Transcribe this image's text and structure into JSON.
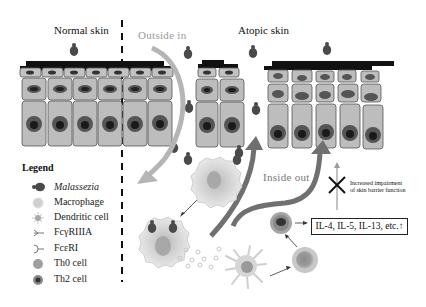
{
  "diagram": {
    "panels": {
      "normal_skin": "Normal skin",
      "atopic_skin": "Atopic skin"
    },
    "pathways": {
      "outside_in": "Outside in",
      "inside_out": "Inside out"
    },
    "annotations": {
      "barrier_line1": "Increased impairment",
      "barrier_line2": "of skin barrier function",
      "cytokines": "IL-4, IL-5, IL-13, etc.↑"
    },
    "legend": {
      "title": "Legend",
      "items": [
        {
          "icon": "malassezia-icon",
          "label": "Malassezia"
        },
        {
          "icon": "macrophage-icon",
          "label": "Macrophage"
        },
        {
          "icon": "dendritic-cell-icon",
          "label": "Dendritic cell"
        },
        {
          "icon": "fcgammariiia-receptor-icon",
          "label": "FcγRIIIA"
        },
        {
          "icon": "fcepsilonri-receptor-icon",
          "label": "FcεRI"
        },
        {
          "icon": "th0-cell-icon",
          "label": "Th0 cell"
        },
        {
          "icon": "th2-cell-icon",
          "label": "Th2 cell"
        }
      ]
    },
    "colors": {
      "cell_fill": "#bdbdbd",
      "cell_stroke": "#555555",
      "nucleus": "#5a5a5a",
      "stratum_corneum": "#111111",
      "outside_in_arrow": "#b5b5b5",
      "inside_out_arrow": "#6e6e6e"
    }
  }
}
